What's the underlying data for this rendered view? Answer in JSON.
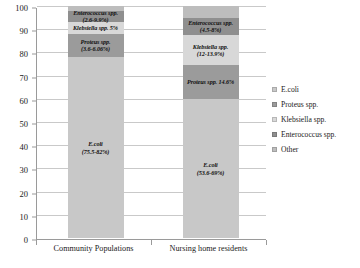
{
  "chart_data": {
    "type": "bar",
    "subtype": "stacked-bar-100",
    "title": "",
    "xlabel": "",
    "ylabel": "",
    "ylim": [
      0,
      100
    ],
    "yticks": [
      0,
      10,
      20,
      30,
      40,
      50,
      60,
      70,
      80,
      90,
      100
    ],
    "grid": true,
    "legend_position": "right",
    "categories": [
      "Community Populations",
      "Nursing home residents"
    ],
    "series": [
      {
        "name": "E.coli",
        "values": [
          78.0,
          59.9
        ],
        "color": "#c8c8c8"
      },
      {
        "name": "Proteus spp.",
        "values": [
          10.0,
          14.6
        ],
        "color": "#9b9b9b"
      },
      {
        "name": "Klebsiella spp.",
        "values": [
          5.0,
          13.0
        ],
        "color": "#d8d8d8"
      },
      {
        "name": "Enterococcus spp.",
        "values": [
          5.0,
          7.5
        ],
        "color": "#8f8f8f"
      },
      {
        "name": "Other",
        "values": [
          2.0,
          5.0
        ],
        "color": "#bdbdbd"
      }
    ],
    "data_labels": [
      {
        "category": "Community Populations",
        "labels": [
          {
            "series": "E.coli",
            "name": "E.coli",
            "value": "(75.5-82%)"
          },
          {
            "series": "Proteus spp.",
            "name": "Proteus spp.",
            "value": "(3.6-6.06%)"
          },
          {
            "series": "Klebsiella spp.",
            "name": "Klebsiella spp.",
            "value": "5%"
          },
          {
            "series": "Enterococcus spp.",
            "name": "Enterococcus spp.",
            "value": "(2.6-9.9%)"
          }
        ]
      },
      {
        "category": "Nursing home residents",
        "labels": [
          {
            "series": "E.coli",
            "name": "E.coli",
            "value": "(53.6-69%)"
          },
          {
            "series": "Proteus spp.",
            "name": "Proteus spp.",
            "value": "14.6%"
          },
          {
            "series": "Klebsiella spp.",
            "name": "Klebsiella spp.",
            "value": "(12-13.9%)"
          },
          {
            "series": "Enterococcus spp.",
            "name": "Enterococcus spp.",
            "value": "(4.5-8%)"
          }
        ]
      }
    ]
  },
  "axis": {
    "y_tick_labels": [
      "100",
      "90",
      "80",
      "70",
      "60",
      "50",
      "40",
      "30",
      "20",
      "10",
      "0"
    ],
    "x_tick_labels": [
      "Community Populations",
      "Nursing home residents"
    ]
  },
  "legend": {
    "items": [
      {
        "label": "E.coli",
        "color": "#c8c8c8"
      },
      {
        "label": "Proteus spp.",
        "color": "#9b9b9b"
      },
      {
        "label": "Klebsiella spp.",
        "color": "#d8d8d8"
      },
      {
        "label": "Enterococcus spp.",
        "color": "#8f8f8f"
      },
      {
        "label": "Other",
        "color": "#bdbdbd"
      }
    ]
  }
}
